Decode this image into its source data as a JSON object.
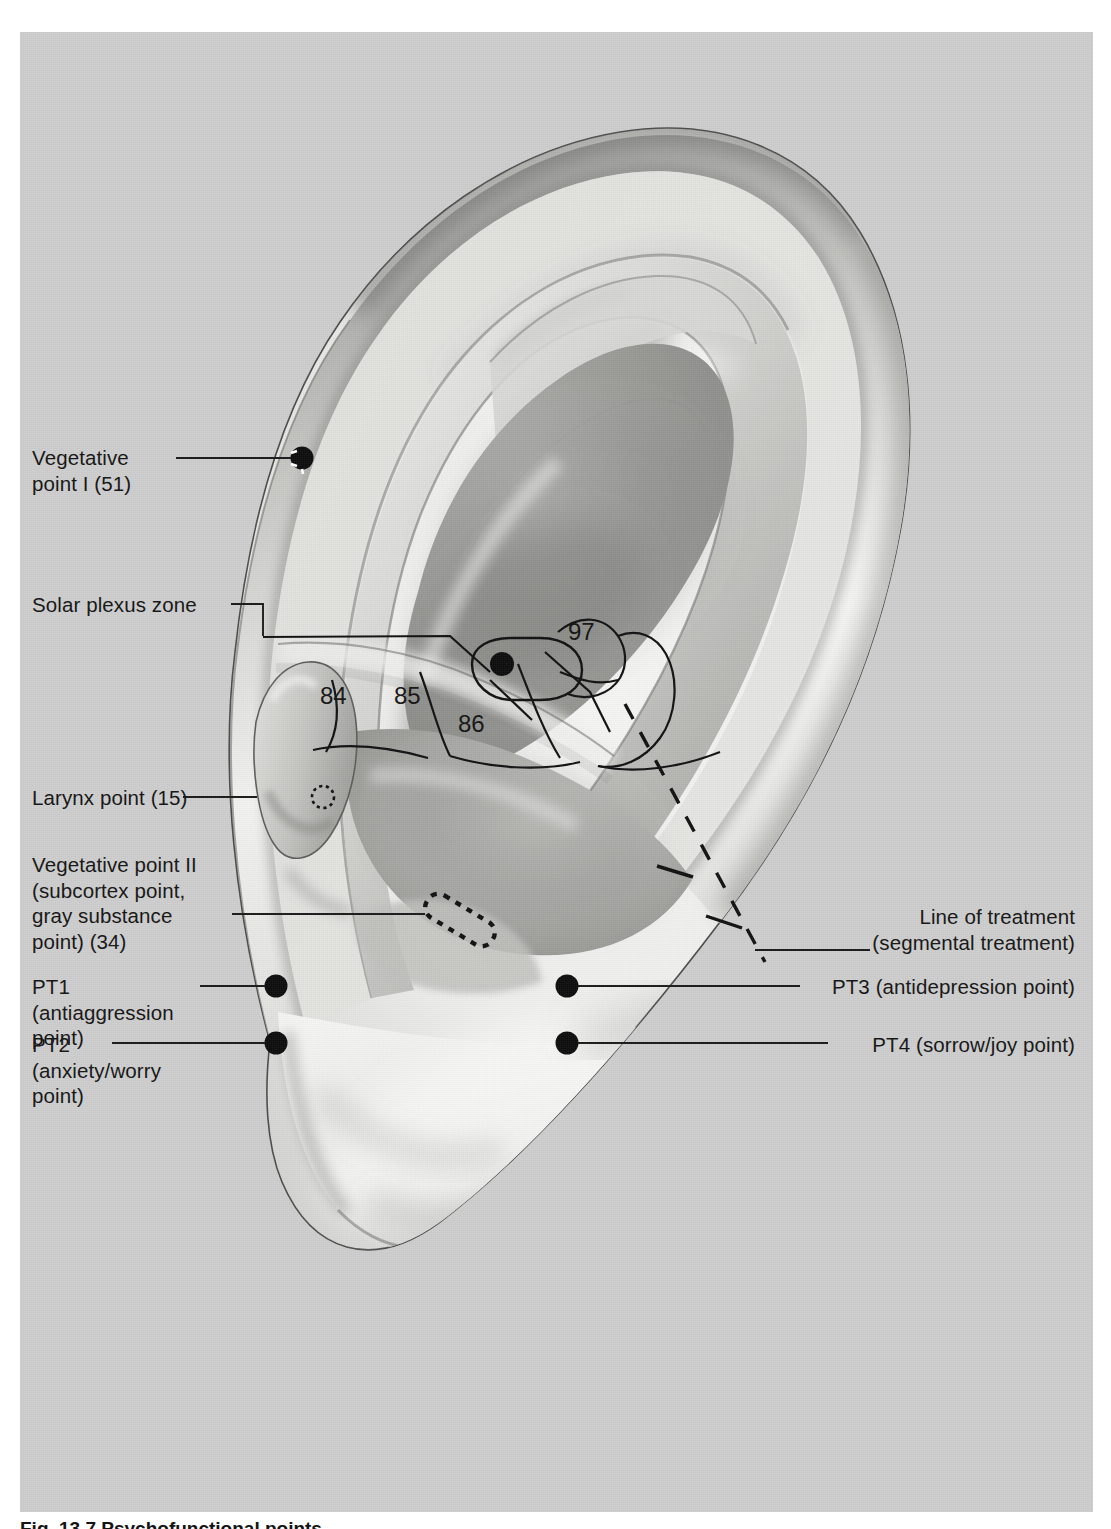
{
  "figure": {
    "kind": "anatomical-illustration",
    "background_color": "#cdcdcd",
    "caption": "Fig. 13.7  Psychofunctional points"
  },
  "labels": {
    "vegetative_point_1": "Vegetative\npoint I (51)",
    "solar_plexus_zone": "Solar plexus zone",
    "larynx_point": "Larynx point (15)",
    "vegetative_point_2": "Vegetative point II\n(subcortex point,\ngray substance\npoint) (34)",
    "pt1": "PT1\n(antiaggression\npoint)",
    "pt2": "PT2\n(anxiety/worry\npoint)",
    "line_of_treatment": "Line of treatment\n(segmental treatment)",
    "pt3": "PT3 (antidepression point)",
    "pt4": "PT4 (sorrow/joy point)"
  },
  "zone_numbers": [
    {
      "id": "zone-84",
      "value": "84"
    },
    {
      "id": "zone-85",
      "value": "85"
    },
    {
      "id": "zone-86",
      "value": "86"
    },
    {
      "id": "zone-97",
      "value": "97"
    }
  ],
  "markers": {
    "vegetative_point_1": {
      "style": "filled-dot-with-white-dashes"
    },
    "solar_plexus_zone": {
      "style": "filled-dot-in-outlined-capsule"
    },
    "larynx_point": {
      "style": "dashed-circle"
    },
    "vegetative_point_2": {
      "style": "dashed-rounded-rectangle"
    },
    "pt1": {
      "style": "filled-dot"
    },
    "pt2": {
      "style": "filled-dot"
    },
    "pt3": {
      "style": "filled-dot"
    },
    "pt4": {
      "style": "filled-dot"
    },
    "line_of_treatment": {
      "style": "dashed-line-with-two-cross-marks"
    }
  },
  "colors": {
    "panel": "#cdcdcd",
    "ink": "#141414",
    "leader_line": "#1a1a1a"
  }
}
